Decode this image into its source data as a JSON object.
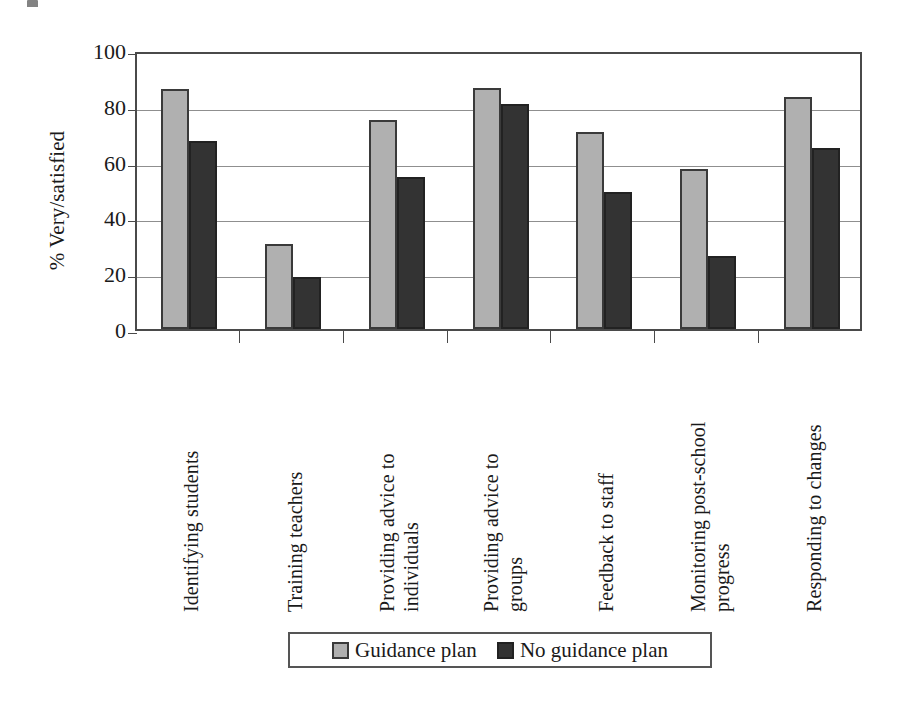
{
  "chart_data": {
    "type": "bar",
    "title": "",
    "xlabel": "",
    "ylabel": "% Very/satisfied",
    "ylim": [
      0,
      100
    ],
    "yticks": [
      0,
      20,
      40,
      60,
      80,
      100
    ],
    "ytick_labels": [
      "0",
      "20",
      "40",
      "60",
      "80",
      "100"
    ],
    "grid": true,
    "legend_position": "bottom",
    "categories": [
      "Identifying students",
      "Training teachers",
      "Providing advice to\nindividuals",
      "Providing advice to\ngroups",
      "Feedback to staff",
      "Monitoring post-school\nprogress",
      "Responding to changes"
    ],
    "series": [
      {
        "name": "Guidance plan",
        "color": "#b0b0b0",
        "values": [
          86,
          30.5,
          75,
          86.5,
          70.5,
          57.5,
          83
        ]
      },
      {
        "name": "No guidance plan",
        "color": "#333333",
        "values": [
          67.5,
          18.5,
          54.5,
          80.5,
          49,
          26,
          65
        ]
      }
    ]
  },
  "colors": {
    "series_light": "#b0b0b0",
    "series_dark": "#333333",
    "axis": "#4a4a4a",
    "gridline": "#8f8f8f",
    "background": "#ffffff"
  }
}
